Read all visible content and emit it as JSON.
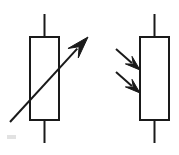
{
  "diagram": {
    "width": 179,
    "height": 155,
    "background_color": "#ffffff",
    "stroke_color": "#1a1a1a",
    "fill_color": "#ffffff",
    "stroke_width": 2,
    "symbols": [
      {
        "id": "variable-resistor",
        "label": "Variable resistor",
        "body": {
          "shape": "rectangle",
          "x": 30,
          "y": 37,
          "width": 29,
          "height": 83
        },
        "leads": [
          {
            "id": "top-lead",
            "x1": 44.5,
            "y1": 14,
            "x2": 44.5,
            "y2": 37
          },
          {
            "id": "bottom-lead",
            "x1": 44.5,
            "y1": 120,
            "x2": 44.5,
            "y2": 143
          }
        ],
        "arrow": {
          "id": "adjust-arrow",
          "description": "diagonal arrow crossing the body from lower-left to upper-right",
          "x1": 10,
          "y1": 122,
          "x2": 88,
          "y2": 37,
          "head_length": 22,
          "head_half_width": 7
        }
      },
      {
        "id": "photoresistor",
        "label": "Photoresistor (LDR)",
        "body": {
          "shape": "rectangle",
          "x": 140,
          "y": 37,
          "width": 29,
          "height": 83
        },
        "leads": [
          {
            "id": "top-lead",
            "x1": 154.5,
            "y1": 14,
            "x2": 154.5,
            "y2": 37
          },
          {
            "id": "bottom-lead",
            "x1": 154.5,
            "y1": 120,
            "x2": 154.5,
            "y2": 143
          }
        ],
        "light_arrows": [
          {
            "id": "light-arrow-upper",
            "description": "incident light arrow pointing down-right toward the body",
            "x1": 116,
            "y1": 49,
            "x2": 140,
            "y2": 70,
            "head_length": 15,
            "head_half_width": 5
          },
          {
            "id": "light-arrow-lower",
            "description": "incident light arrow pointing down-right toward the body",
            "x1": 116,
            "y1": 72,
            "x2": 140,
            "y2": 93,
            "head_length": 15,
            "head_half_width": 5
          }
        ]
      }
    ],
    "artifacts": [
      {
        "id": "scan-speck",
        "description": "faint scanning speck near lower-left",
        "x": 7,
        "y": 135,
        "width": 9,
        "height": 4,
        "color": "#e2e2e2"
      }
    ]
  }
}
